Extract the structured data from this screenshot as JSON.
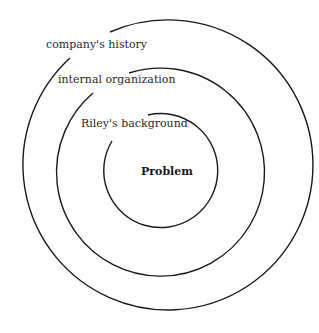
{
  "diagram": {
    "type": "concentric-circles",
    "center_label": "Problem",
    "rings": [
      {
        "label": "Riley's background"
      },
      {
        "label": "internal organization"
      },
      {
        "label": "company's history"
      }
    ]
  }
}
